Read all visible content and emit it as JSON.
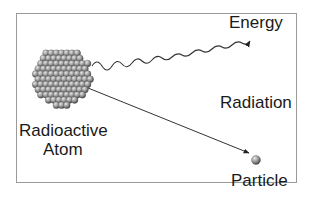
{
  "diagram": {
    "labels": {
      "energy": "Energy",
      "radiation": "Radiation",
      "atom_line1": "Radioactive",
      "atom_line2": "Atom",
      "particle": "Particle"
    },
    "colors": {
      "frame": "#9a9a9a",
      "line": "#333333",
      "sphere_light": "#d8d8d8",
      "sphere_dark": "#5a5a5a",
      "text": "#1a1a1a"
    },
    "nodes": [
      {
        "id": "atom",
        "label": "Radioactive Atom",
        "shape": "nucleus-cluster"
      },
      {
        "id": "energy",
        "label": "Energy",
        "shape": "wavy-arrow"
      },
      {
        "id": "particle",
        "label": "Particle",
        "shape": "sphere"
      }
    ],
    "edges": [
      {
        "from": "atom",
        "to": "energy",
        "style": "wavy"
      },
      {
        "from": "atom",
        "to": "particle",
        "style": "straight-arrow"
      }
    ]
  }
}
